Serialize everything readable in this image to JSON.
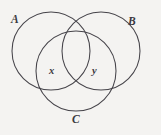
{
  "figure": {
    "type": "venn-diagram",
    "background_color": "#f4f3f1",
    "stroke_color": "#46444a"
  },
  "sets": [
    {
      "id": "A",
      "label": "A",
      "cx": 51,
      "cy": 51,
      "r": 39
    },
    {
      "id": "B",
      "label": "B",
      "cx": 101,
      "cy": 51,
      "r": 39
    },
    {
      "id": "C",
      "label": "C",
      "cx": 76,
      "cy": 71,
      "r": 40
    }
  ],
  "regions": [
    {
      "id": "x",
      "label": "x"
    },
    {
      "id": "y",
      "label": "y"
    }
  ]
}
